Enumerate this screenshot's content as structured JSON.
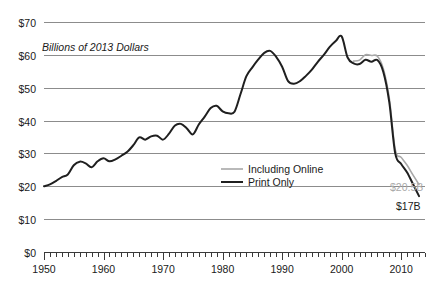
{
  "chart_data": {
    "type": "line",
    "title": "",
    "subtitle": "",
    "axis_note": "Billions of 2013 Dollars",
    "xlabel": "",
    "ylabel": "",
    "xlim": [
      1950,
      2014
    ],
    "ylim": [
      0,
      70
    ],
    "grid": true,
    "grid_axis": "y",
    "legend_position": "inside-center-right",
    "y_ticks": [
      0,
      10,
      20,
      30,
      40,
      50,
      60,
      70
    ],
    "y_tick_labels": [
      "$0",
      "$10",
      "$20",
      "$30",
      "$40",
      "$50",
      "$60",
      "$70"
    ],
    "x_ticks": [
      1950,
      1960,
      1970,
      1980,
      1990,
      2000,
      2010
    ],
    "x_tick_labels": [
      "1950",
      "1960",
      "1970",
      "1980",
      "1990",
      "2000",
      "2010"
    ],
    "x_minor_tick_step": 1,
    "x": [
      1950,
      1951,
      1952,
      1953,
      1954,
      1955,
      1956,
      1957,
      1958,
      1959,
      1960,
      1961,
      1962,
      1963,
      1964,
      1965,
      1966,
      1967,
      1968,
      1969,
      1970,
      1971,
      1972,
      1973,
      1974,
      1975,
      1976,
      1977,
      1978,
      1979,
      1980,
      1981,
      1982,
      1983,
      1984,
      1985,
      1986,
      1987,
      1988,
      1989,
      1990,
      1991,
      1992,
      1993,
      1994,
      1995,
      1996,
      1997,
      1998,
      1999,
      2000,
      2001,
      2002,
      2003,
      2004,
      2005,
      2006,
      2007,
      2008,
      2009,
      2010,
      2011,
      2012,
      2013
    ],
    "series": [
      {
        "name": "Print Only",
        "color": "#1f1f1f",
        "style": "solid",
        "width": 2,
        "values": [
          20.0,
          20.6,
          21.6,
          22.8,
          23.6,
          26.4,
          27.5,
          27.0,
          25.8,
          27.6,
          28.5,
          27.6,
          28.2,
          29.3,
          30.5,
          32.5,
          34.9,
          34.2,
          35.2,
          35.4,
          34.2,
          36.0,
          38.5,
          39.0,
          37.6,
          35.8,
          38.8,
          41.2,
          43.8,
          44.5,
          42.8,
          42.2,
          42.7,
          48.0,
          53.5,
          56.2,
          58.6,
          60.6,
          61.2,
          59.4,
          56.4,
          52.0,
          51.2,
          52.0,
          53.6,
          55.5,
          57.9,
          60.0,
          62.4,
          64.2,
          65.6,
          59.2,
          57.4,
          57.2,
          58.5,
          57.9,
          58.4,
          54.8,
          45.6,
          30.0,
          26.8,
          24.2,
          20.6,
          17.0
        ]
      },
      {
        "name": "Including Online",
        "color": "#a8a8a8",
        "style": "solid",
        "width": 1.6,
        "values": [
          null,
          null,
          null,
          null,
          null,
          null,
          null,
          null,
          null,
          null,
          null,
          null,
          null,
          null,
          null,
          null,
          null,
          null,
          null,
          null,
          null,
          null,
          null,
          null,
          null,
          null,
          null,
          null,
          null,
          null,
          null,
          null,
          null,
          null,
          null,
          null,
          null,
          null,
          null,
          null,
          null,
          null,
          null,
          null,
          null,
          null,
          null,
          null,
          null,
          null,
          null,
          null,
          58.1,
          58.4,
          60.0,
          59.8,
          59.6,
          55.8,
          46.8,
          31.2,
          28.8,
          26.4,
          23.4,
          20.5
        ]
      }
    ],
    "annotations": [
      {
        "name": "print-end-label",
        "text": "$17B",
        "series": "Print Only",
        "x": 2013,
        "y": 17.0,
        "color": "#1a1a1a"
      },
      {
        "name": "online-end-label",
        "text": "$20.5B",
        "series": "Including Online",
        "x": 2013,
        "y": 20.5,
        "color": "#aaaaaa"
      }
    ],
    "legend": [
      {
        "label": "Including Online",
        "color": "#a8a8a8"
      },
      {
        "label": "Print Only",
        "color": "#1f1f1f"
      }
    ]
  },
  "colors": {
    "print": "#1f1f1f",
    "online": "#a8a8a8",
    "grid": "#8c8c8c",
    "axis": "#3a3a3a",
    "text": "#1a1a1a",
    "annotation_gray": "#aaaaaa",
    "background": "#ffffff"
  }
}
